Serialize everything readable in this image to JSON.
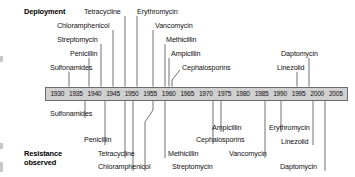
{
  "figure": {
    "type": "timeline",
    "bar_color": "#d0d0d0",
    "leader_color": "#4d4d4d"
  },
  "sections": {
    "top_title": "Deployment",
    "bottom_title_line1": "Resistance",
    "bottom_title_line2": "observed"
  },
  "axis": {
    "start": 1930,
    "end": 2005,
    "step": 5,
    "ticks": [
      "1930",
      "1935",
      "1940",
      "1945",
      "1950",
      "1955",
      "1960",
      "1965",
      "1970",
      "1975",
      "1980",
      "1985",
      "1990",
      "1995",
      "2000",
      "2005"
    ]
  },
  "chart_data": {
    "type": "timeline",
    "xlabel": "Year",
    "xlim": [
      1930,
      2005
    ],
    "series": [
      {
        "name": "Deployment",
        "events": [
          {
            "label": "Sulfonamides",
            "year": 1936
          },
          {
            "label": "Penicillin",
            "year": 1941
          },
          {
            "label": "Streptomycin",
            "year": 1944
          },
          {
            "label": "Chloramphenicol",
            "year": 1947
          },
          {
            "label": "Tetracycline",
            "year": 1950
          },
          {
            "label": "Erythromycin",
            "year": 1953
          },
          {
            "label": "Vancomycin",
            "year": 1957
          },
          {
            "label": "Methicillin",
            "year": 1959
          },
          {
            "label": "Ampicillin",
            "year": 1960
          },
          {
            "label": "Cephalosporins",
            "year": 1961
          },
          {
            "label": "Linezolid",
            "year": 2000
          },
          {
            "label": "Daptomycin",
            "year": 2003
          }
        ]
      },
      {
        "name": "Resistance observed",
        "events": [
          {
            "label": "Sulfonamides",
            "year": 1940
          },
          {
            "label": "Penicillin",
            "year": 1945
          },
          {
            "label": "Streptomycin",
            "year": 1957
          },
          {
            "label": "Tetracycline",
            "year": 1950
          },
          {
            "label": "Chloramphenicol",
            "year": 1947
          },
          {
            "label": "Methicillin",
            "year": 1961
          },
          {
            "label": "Ampicillin",
            "year": 1973
          },
          {
            "label": "Cephalosporins",
            "year": 1971
          },
          {
            "label": "Vancomycin",
            "year": 1986
          },
          {
            "label": "Erythromycin",
            "year": 1990
          },
          {
            "label": "Linezolid",
            "year": 2001
          },
          {
            "label": "Daptomycin",
            "year": 2004
          }
        ]
      }
    ]
  },
  "top_labels": [
    {
      "text": "Tetracycline",
      "x": 84,
      "y": 8
    },
    {
      "text": "Erythromycin",
      "x": 137,
      "y": 8
    },
    {
      "text": "Chloramphenicol",
      "x": 57,
      "y": 22
    },
    {
      "text": "Vancomycin",
      "x": 155,
      "y": 22
    },
    {
      "text": "Streptomycin",
      "x": 57,
      "y": 36
    },
    {
      "text": "Methicillin",
      "x": 166,
      "y": 36
    },
    {
      "text": "Penicillin",
      "x": 70,
      "y": 50
    },
    {
      "text": "Ampicillin",
      "x": 171,
      "y": 50
    },
    {
      "text": "Daptomycin",
      "x": 281,
      "y": 50
    },
    {
      "text": "Sulfonamides",
      "x": 50,
      "y": 64
    },
    {
      "text": "Cephalosporins",
      "x": 182,
      "y": 64
    },
    {
      "text": "Linezolid",
      "x": 277,
      "y": 64
    }
  ],
  "bottom_labels": [
    {
      "text": "Sulfonamides",
      "x": 50,
      "y": 110
    },
    {
      "text": "Ampicillin",
      "x": 212,
      "y": 124
    },
    {
      "text": "Erythromycin",
      "x": 269,
      "y": 124
    },
    {
      "text": "Penicillin",
      "x": 84,
      "y": 136
    },
    {
      "text": "Cephalosporins",
      "x": 196,
      "y": 136
    },
    {
      "text": "Linezolid",
      "x": 281,
      "y": 138
    },
    {
      "text": "Tetracycline",
      "x": 98,
      "y": 150
    },
    {
      "text": "Methicillin",
      "x": 168,
      "y": 150
    },
    {
      "text": "Vancomycin",
      "x": 229,
      "y": 150
    },
    {
      "text": "Chloramphenicol",
      "x": 98,
      "y": 163
    },
    {
      "text": "Streptomycin",
      "x": 172,
      "y": 163
    },
    {
      "text": "Daptomycin",
      "x": 280,
      "y": 163
    }
  ]
}
